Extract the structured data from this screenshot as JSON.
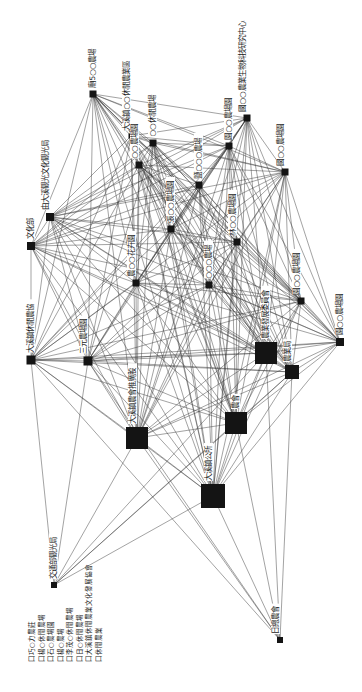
{
  "diagram": {
    "type": "network-sociogram",
    "orientation": "rotated-90",
    "nodes": [
      {
        "id": "n1",
        "label": "國○○農業生物科技研究中心",
        "x": 247,
        "y": 118,
        "size": 7
      },
      {
        "id": "n2",
        "label": "園○○農場園",
        "x": 229,
        "y": 146,
        "size": 7
      },
      {
        "id": "n3",
        "label": "國○○農場園",
        "x": 285,
        "y": 172,
        "size": 7
      },
      {
        "id": "n4",
        "label": "廟5○○農場",
        "x": 93,
        "y": 94,
        "size": 7
      },
      {
        "id": "n5",
        "label": "大溪鎮○○休閒農業區",
        "x": 131,
        "y": 136,
        "size": 5
      },
      {
        "id": "n6",
        "label": "○○休閒農場",
        "x": 153,
        "y": 143,
        "size": 7
      },
      {
        "id": "n7",
        "label": "○○農場園",
        "x": 139,
        "y": 165,
        "size": 7
      },
      {
        "id": "n8",
        "label": "鹽○○○農場",
        "x": 199,
        "y": 185,
        "size": 7
      },
      {
        "id": "n9",
        "label": "由大溪觀光文化觀光局",
        "x": 50,
        "y": 217,
        "size": 8
      },
      {
        "id": "n10",
        "label": "文化部",
        "x": 31,
        "y": 246,
        "size": 8
      },
      {
        "id": "n11",
        "label": "林○○農場園",
        "x": 237,
        "y": 242,
        "size": 7
      },
      {
        "id": "n12",
        "label": "張○○農場園",
        "x": 171,
        "y": 229,
        "size": 7
      },
      {
        "id": "n13",
        "label": "農○○花卉園",
        "x": 136,
        "y": 283,
        "size": 7
      },
      {
        "id": "n14",
        "label": "○○○農場",
        "x": 209,
        "y": 285,
        "size": 7
      },
      {
        "id": "n15",
        "label": "園○○農場園",
        "x": 301,
        "y": 301,
        "size": 7
      },
      {
        "id": "n16",
        "label": "大溪鎮休閒農協",
        "x": 31,
        "y": 360,
        "size": 9
      },
      {
        "id": "n17",
        "label": "三元農場園",
        "x": 88,
        "y": 361,
        "size": 9
      },
      {
        "id": "n18",
        "label": "農業發展委員會",
        "x": 266,
        "y": 353,
        "size": 22
      },
      {
        "id": "n19",
        "label": "農業局",
        "x": 292,
        "y": 372,
        "size": 14
      },
      {
        "id": "n20",
        "label": "園○○農場園",
        "x": 340,
        "y": 342,
        "size": 8
      },
      {
        "id": "n21",
        "label": "大溪鎮農會推廣股",
        "x": 137,
        "y": 438,
        "size": 22
      },
      {
        "id": "n22",
        "label": "農會",
        "x": 236,
        "y": 423,
        "size": 22
      },
      {
        "id": "n23",
        "label": "大溪鎮公所",
        "x": 213,
        "y": 496,
        "size": 24
      },
      {
        "id": "n24",
        "label": "交通部觀光局",
        "x": 54,
        "y": 585,
        "size": 6
      },
      {
        "id": "n25",
        "label": "日總農會",
        "x": 280,
        "y": 640,
        "size": 6
      }
    ],
    "legend": [
      "口巧○力農莊",
      "口楊○休閒農場",
      "口石○農場園",
      "口楊○農場",
      "口李茂○休閒農場",
      "口日○休閒農場",
      "口大溪鎮休閒農業文化發展協會",
      "口休閒農業"
    ]
  }
}
